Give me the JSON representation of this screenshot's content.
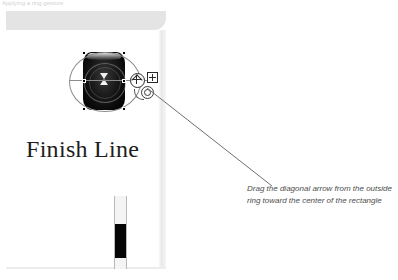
{
  "top_strip": {
    "clipped_text": "Applying a ring gesture"
  },
  "document_panel": {
    "caption": "Finish Line",
    "object": {
      "name": "rounded-rectangle-shape",
      "selection_ring_label": "outside ring",
      "handles": [
        "rotate-handle",
        "move-handle",
        "resize-handle"
      ]
    },
    "slider": {
      "name": "vertical-scrollbar",
      "thumb_position_percent": 36
    }
  },
  "annotation": {
    "text": "Drag the diagonal arrow from the outside ring toward the center of the rectangle"
  },
  "colors": {
    "panel_header": "#e4e4e4",
    "object_fill": "#0a0a0a",
    "selection_stroke": "#8d8d8d",
    "leader_line": "#6f6f6f",
    "note_text": "#4d4d4d",
    "slider_thumb": "#050505"
  }
}
